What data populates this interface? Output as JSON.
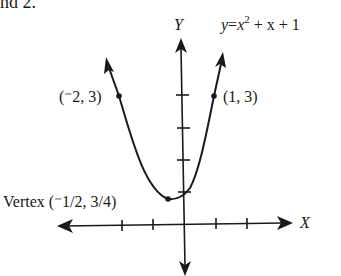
{
  "page_fragment": "nd 2.",
  "graph": {
    "equation": {
      "lhs": "y",
      "eq": "=",
      "x": "x",
      "exp": "2",
      "rest": " + x + 1"
    },
    "y_axis_label": "Y",
    "x_axis_label": "X",
    "points": [
      {
        "label": "(⁻2, 3)",
        "x": -2,
        "y": 3
      },
      {
        "label": "(1, 3)",
        "x": 1,
        "y": 3
      }
    ],
    "vertex": {
      "label": "Vertex (⁻1/2, 3/4)",
      "x": -0.5,
      "y": 0.75
    },
    "colors": {
      "ink": "#1a1a1a",
      "background": "#ffffff"
    }
  }
}
